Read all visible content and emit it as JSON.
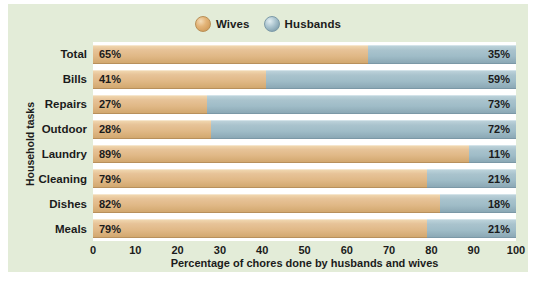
{
  "chart_data": {
    "type": "bar",
    "orientation": "horizontal",
    "stacked": true,
    "title": "",
    "xlabel": "Percentage of chores done by husbands and wives",
    "ylabel": "Household tasks",
    "xlim": [
      0,
      100
    ],
    "xticks": [
      0,
      10,
      20,
      30,
      40,
      50,
      60,
      70,
      80,
      90,
      100
    ],
    "grid": false,
    "legend_position": "top-center",
    "categories": [
      "Total",
      "Bills",
      "Repairs",
      "Outdoor",
      "Laundry",
      "Cleaning",
      "Dishes",
      "Meals"
    ],
    "series": [
      {
        "name": "Wives",
        "color": "#e0b886",
        "values": [
          65,
          41,
          27,
          28,
          89,
          79,
          82,
          79
        ],
        "labels": [
          "65%",
          "41%",
          "27%",
          "28%",
          "89%",
          "79%",
          "82%",
          "79%"
        ]
      },
      {
        "name": "Husbands",
        "color": "#9fbcc7",
        "values": [
          35,
          59,
          73,
          72,
          11,
          21,
          18,
          21
        ],
        "labels": [
          "35%",
          "59%",
          "73%",
          "72%",
          "11%",
          "21%",
          "18%",
          "21%"
        ]
      }
    ]
  },
  "legend": {
    "entries": [
      {
        "label": "Wives",
        "icon": "sphere-orange-icon"
      },
      {
        "label": "Husbands",
        "icon": "sphere-blue-icon"
      }
    ]
  },
  "colors": {
    "panel_background": "#e3ecd8",
    "plot_background": "#ffffff",
    "wives": "#e0b886",
    "husbands": "#9fbcc7",
    "text": "#1b1b1b"
  }
}
